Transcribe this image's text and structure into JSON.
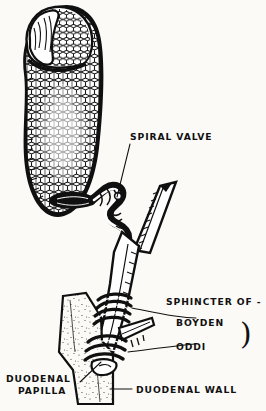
{
  "figure": {
    "background_color": "#fbfaf7",
    "ink_color": "#101010",
    "style": "black-and-white line drawing, cross-section, hand-lettered labels"
  },
  "labels": {
    "spiral_valve": "SPIRAL VALVE",
    "sphincter_of": "SPHINCTER OF -",
    "boyden": "BOYDEN",
    "oddi": "ODDI",
    "duodenal_papilla_line1": "DUODENAL",
    "duodenal_papilla_line2": "PAPILLA",
    "duodenal_wall": "DUODENAL WALL",
    "brace": ")"
  },
  "structures": [
    {
      "name": "gallbladder",
      "description": "opened gallbladder with reticular mucosal lining",
      "label": ""
    },
    {
      "name": "gallbladder-fundus",
      "description": "folded cut edge at fundus",
      "label": ""
    },
    {
      "name": "cystic-duct",
      "description": "tortuous neck containing spiral valve",
      "label": "SPIRAL VALVE"
    },
    {
      "name": "hepatic-duct",
      "description": "duct descending from upper right, cut off at top",
      "label": ""
    },
    {
      "name": "common-bile-duct",
      "description": "duct formed below the junction, descends to duodenum",
      "label": ""
    },
    {
      "name": "sphincter-boyden",
      "description": "upper band of circular muscle coils around bile duct",
      "label": "BOYDEN"
    },
    {
      "name": "sphincter-oddi",
      "description": "lower band of circular muscle coils at the papilla",
      "label": "ODDI"
    },
    {
      "name": "pancreatic-duct",
      "description": "small duct joining the bile duct from the right",
      "label": ""
    },
    {
      "name": "duodenal-papilla",
      "description": "opening of the bile duct into the duodenum",
      "label": "DUODENAL PAPILLA"
    },
    {
      "name": "duodenal-wall",
      "description": "stippled band of duodenal wall crossing the lower figure",
      "label": "DUODENAL WALL"
    }
  ]
}
